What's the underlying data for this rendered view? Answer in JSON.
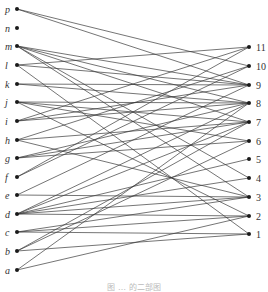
{
  "figure": {
    "caption": "图 … 的二部图",
    "left_nodes": [
      {
        "id": "p",
        "y": 9
      },
      {
        "id": "n",
        "y": 28
      },
      {
        "id": "m",
        "y": 46
      },
      {
        "id": "l",
        "y": 65
      },
      {
        "id": "k",
        "y": 84
      },
      {
        "id": "j",
        "y": 102
      },
      {
        "id": "i",
        "y": 121
      },
      {
        "id": "h",
        "y": 140
      },
      {
        "id": "g",
        "y": 158
      },
      {
        "id": "f",
        "y": 177
      },
      {
        "id": "e",
        "y": 195
      },
      {
        "id": "d",
        "y": 214
      },
      {
        "id": "c",
        "y": 232
      },
      {
        "id": "b",
        "y": 251
      },
      {
        "id": "a",
        "y": 270
      }
    ],
    "right_nodes": [
      {
        "id": "11",
        "y": 47
      },
      {
        "id": "10",
        "y": 66
      },
      {
        "id": "9",
        "y": 85
      },
      {
        "id": "8",
        "y": 103
      },
      {
        "id": "7",
        "y": 122
      },
      {
        "id": "6",
        "y": 141
      },
      {
        "id": "5",
        "y": 159
      },
      {
        "id": "4",
        "y": 178
      },
      {
        "id": "3",
        "y": 197
      },
      {
        "id": "2",
        "y": 216
      },
      {
        "id": "1",
        "y": 234
      }
    ],
    "edges": [
      [
        "p",
        "10"
      ],
      [
        "p",
        "9"
      ],
      [
        "m",
        "9"
      ],
      [
        "m",
        "8"
      ],
      [
        "m",
        "7"
      ],
      [
        "m",
        "4"
      ],
      [
        "m",
        "3"
      ],
      [
        "l",
        "11"
      ],
      [
        "l",
        "9"
      ],
      [
        "l",
        "1"
      ],
      [
        "k",
        "9"
      ],
      [
        "k",
        "8"
      ],
      [
        "j",
        "8"
      ],
      [
        "j",
        "7"
      ],
      [
        "j",
        "6"
      ],
      [
        "j",
        "2"
      ],
      [
        "i",
        "11"
      ],
      [
        "i",
        "9"
      ],
      [
        "i",
        "8"
      ],
      [
        "h",
        "10"
      ],
      [
        "h",
        "7"
      ],
      [
        "h",
        "3"
      ],
      [
        "g",
        "8"
      ],
      [
        "g",
        "7"
      ],
      [
        "g",
        "6"
      ],
      [
        "f",
        "11"
      ],
      [
        "f",
        "10"
      ],
      [
        "e",
        "9"
      ],
      [
        "e",
        "3"
      ],
      [
        "d",
        "8"
      ],
      [
        "d",
        "7"
      ],
      [
        "d",
        "5"
      ],
      [
        "d",
        "4"
      ],
      [
        "d",
        "3"
      ],
      [
        "d",
        "2"
      ],
      [
        "c",
        "3"
      ],
      [
        "c",
        "2"
      ],
      [
        "c",
        "1"
      ],
      [
        "b",
        "7"
      ],
      [
        "b",
        "6"
      ],
      [
        "b",
        "1"
      ],
      [
        "a",
        "8"
      ],
      [
        "a",
        "2"
      ]
    ]
  }
}
